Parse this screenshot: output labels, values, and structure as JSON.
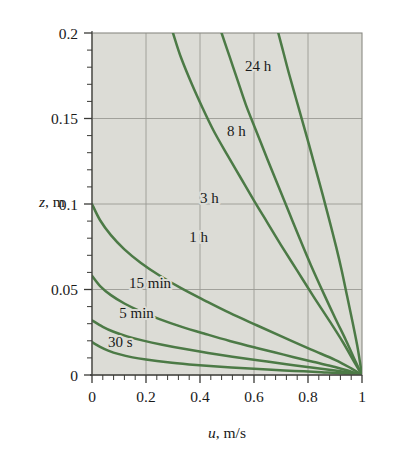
{
  "chart_data": {
    "type": "line",
    "title": "",
    "xlabel": "u, m/s",
    "ylabel": "z, m",
    "xlabel_italic": "u",
    "xlabel_rest": ", m/s",
    "ylabel_italic": "z",
    "ylabel_rest": ", m",
    "xlim": [
      0,
      1
    ],
    "ylim": [
      0,
      0.2
    ],
    "xticks": [
      0,
      0.2,
      0.4,
      0.6,
      0.8,
      1
    ],
    "xticklabels": [
      "0",
      "0.2",
      "0.4",
      "0.6",
      "0.8",
      "1"
    ],
    "yticks": [
      0,
      0.05,
      0.1,
      0.15,
      0.2
    ],
    "yticklabels": [
      "0",
      "0.05",
      "0.1",
      "0.15",
      "0.2"
    ],
    "x_minor_step": 0.04,
    "y_minor_step": 0.01,
    "grid": true,
    "grid_color": "#9a9a94",
    "plot_bg": "#dcdcd6",
    "curve_color": "#4c7a46",
    "legend_position": "inline-labels",
    "series": [
      {
        "name": "30 s",
        "label": "30 s",
        "label_x": 0.105,
        "label_y": 0.0165,
        "points": [
          [
            0.0,
            0.0192
          ],
          [
            0.03,
            0.0165
          ],
          [
            0.06,
            0.0143
          ],
          [
            0.1,
            0.0122
          ],
          [
            0.15,
            0.0103
          ],
          [
            0.2,
            0.009
          ],
          [
            0.28,
            0.0074
          ],
          [
            0.36,
            0.0062
          ],
          [
            0.45,
            0.0051
          ],
          [
            0.55,
            0.0041
          ],
          [
            0.65,
            0.0032
          ],
          [
            0.75,
            0.0024
          ],
          [
            0.85,
            0.0016
          ],
          [
            0.93,
            0.0009
          ],
          [
            1.0,
            0.0
          ]
        ]
      },
      {
        "name": "5 min",
        "label": "5 min",
        "label_x": 0.165,
        "label_y": 0.0335,
        "points": [
          [
            0.0,
            0.032
          ],
          [
            0.04,
            0.0282
          ],
          [
            0.08,
            0.0253
          ],
          [
            0.13,
            0.0226
          ],
          [
            0.19,
            0.0201
          ],
          [
            0.26,
            0.0177
          ],
          [
            0.34,
            0.0153
          ],
          [
            0.43,
            0.0129
          ],
          [
            0.52,
            0.0107
          ],
          [
            0.62,
            0.0085
          ],
          [
            0.72,
            0.0063
          ],
          [
            0.82,
            0.0042
          ],
          [
            0.9,
            0.0026
          ],
          [
            0.96,
            0.0012
          ],
          [
            1.0,
            0.0
          ]
        ]
      },
      {
        "name": "15 min",
        "label": "15 min",
        "label_x": 0.215,
        "label_y": 0.051,
        "points": [
          [
            0.0,
            0.058
          ],
          [
            0.03,
            0.052
          ],
          [
            0.07,
            0.0467
          ],
          [
            0.12,
            0.0418
          ],
          [
            0.18,
            0.0372
          ],
          [
            0.25,
            0.0327
          ],
          [
            0.33,
            0.0283
          ],
          [
            0.42,
            0.024
          ],
          [
            0.51,
            0.0199
          ],
          [
            0.61,
            0.0158
          ],
          [
            0.71,
            0.0119
          ],
          [
            0.81,
            0.008
          ],
          [
            0.9,
            0.0047
          ],
          [
            0.96,
            0.002
          ],
          [
            1.0,
            0.0
          ]
        ]
      },
      {
        "name": "1 h",
        "label": "1 h",
        "label_x": 0.395,
        "label_y": 0.0775,
        "points": [
          [
            0.0,
            0.1
          ],
          [
            0.03,
            0.0905
          ],
          [
            0.07,
            0.0818
          ],
          [
            0.12,
            0.0735
          ],
          [
            0.18,
            0.0657
          ],
          [
            0.25,
            0.0582
          ],
          [
            0.33,
            0.0508
          ],
          [
            0.42,
            0.0434
          ],
          [
            0.51,
            0.0363
          ],
          [
            0.61,
            0.0291
          ],
          [
            0.71,
            0.022
          ],
          [
            0.81,
            0.015
          ],
          [
            0.9,
            0.0089
          ],
          [
            0.96,
            0.0039
          ],
          [
            1.0,
            0.0
          ]
        ]
      },
      {
        "name": "3 h",
        "label": "3 h",
        "label_x": 0.435,
        "label_y": 0.1005,
        "points": [
          [
            0.3,
            0.2
          ],
          [
            0.33,
            0.1855
          ],
          [
            0.37,
            0.17
          ],
          [
            0.41,
            0.156
          ],
          [
            0.45,
            0.143
          ],
          [
            0.5,
            0.129
          ],
          [
            0.55,
            0.1155
          ],
          [
            0.6,
            0.102
          ],
          [
            0.65,
            0.089
          ],
          [
            0.7,
            0.076
          ],
          [
            0.76,
            0.061
          ],
          [
            0.82,
            0.046
          ],
          [
            0.88,
            0.0315
          ],
          [
            0.93,
            0.019
          ],
          [
            0.97,
            0.008
          ],
          [
            1.0,
            0.0
          ]
        ]
      },
      {
        "name": "8 h",
        "label": "8 h",
        "label_x": 0.535,
        "label_y": 0.14,
        "points": [
          [
            0.48,
            0.2
          ],
          [
            0.51,
            0.186
          ],
          [
            0.54,
            0.172
          ],
          [
            0.57,
            0.158
          ],
          [
            0.61,
            0.142
          ],
          [
            0.65,
            0.126
          ],
          [
            0.69,
            0.1105
          ],
          [
            0.73,
            0.095
          ],
          [
            0.77,
            0.0795
          ],
          [
            0.81,
            0.0645
          ],
          [
            0.86,
            0.047
          ],
          [
            0.9,
            0.0335
          ],
          [
            0.94,
            0.0205
          ],
          [
            0.97,
            0.01
          ],
          [
            1.0,
            0.0
          ]
        ]
      },
      {
        "name": "24 h",
        "label": "24 h",
        "label_x": 0.615,
        "label_y": 0.1775,
        "points": [
          [
            0.69,
            0.2
          ],
          [
            0.71,
            0.188
          ],
          [
            0.73,
            0.176
          ],
          [
            0.755,
            0.162
          ],
          [
            0.78,
            0.148
          ],
          [
            0.805,
            0.134
          ],
          [
            0.83,
            0.1195
          ],
          [
            0.855,
            0.105
          ],
          [
            0.88,
            0.09
          ],
          [
            0.905,
            0.0745
          ],
          [
            0.925,
            0.061
          ],
          [
            0.945,
            0.046
          ],
          [
            0.965,
            0.031
          ],
          [
            0.982,
            0.0175
          ],
          [
            0.993,
            0.007
          ],
          [
            1.0,
            0.0
          ]
        ]
      }
    ]
  }
}
